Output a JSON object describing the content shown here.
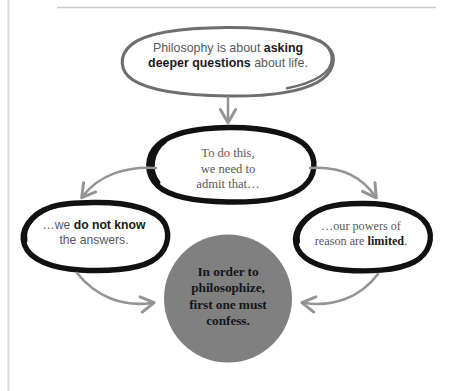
{
  "diagram": {
    "title": "In order to philosophize, first one must confess.",
    "colors": {
      "grey_circle_fill": "#808080",
      "grey_outline": "#6e6e6e",
      "black_outline": "#111111",
      "arrow_grey": "#949494",
      "rule_grey": "#c9c9c9",
      "body_text": "#58585a",
      "bold_text": "#1a1a1a",
      "page_background": "#ffffff"
    },
    "nodes": {
      "premise": {
        "text_plain": "Philosophy is about asking deeper questions about life.",
        "line1_normal": "Philosophy is about ",
        "line1_bold": "asking",
        "line2_bold": "deeper questions",
        "line2_normal": " about life.",
        "shape": "ellipse",
        "outline": "grey"
      },
      "admit": {
        "text_plain": "To do this, we need to admit that…",
        "line1": "To do this,",
        "line2": "we need to",
        "line3": "admit that…",
        "shape": "ellipse",
        "outline": "black"
      },
      "left_branch": {
        "text_plain": "…we do not know the answers.",
        "line1_normal": "…we ",
        "line1_bold": "do not know",
        "line2_normal": "the answers.",
        "shape": "ellipse",
        "outline": "black"
      },
      "right_branch": {
        "text_plain": "…our powers of reason are limited.",
        "line1_normal": "…our powers of",
        "line2_normal": "reason are ",
        "line2_bold": "limited",
        "line2_tail": ".",
        "shape": "ellipse",
        "outline": "black"
      },
      "conclusion": {
        "text_plain": "In order to philosophize, first one must confess.",
        "line1": "In order to",
        "line2": "philosophize,",
        "line3": "first one must",
        "line4": "confess.",
        "shape": "filled-circle",
        "fill": "#808080"
      }
    },
    "arrows": [
      {
        "name": "premise-to-admit",
        "from": "premise",
        "to": "admit",
        "style": "straight-down",
        "color": "#949494"
      },
      {
        "name": "admit-to-left",
        "from": "admit",
        "to": "left_branch",
        "style": "curve-down-left",
        "color": "#949494"
      },
      {
        "name": "admit-to-right",
        "from": "admit",
        "to": "right_branch",
        "style": "curve-down-right",
        "color": "#949494"
      },
      {
        "name": "left-to-conclusion",
        "from": "left_branch",
        "to": "conclusion",
        "style": "curve-down-right",
        "color": "#949494"
      },
      {
        "name": "right-to-conclusion",
        "from": "right_branch",
        "to": "conclusion",
        "style": "curve-down-left",
        "color": "#949494"
      }
    ]
  }
}
